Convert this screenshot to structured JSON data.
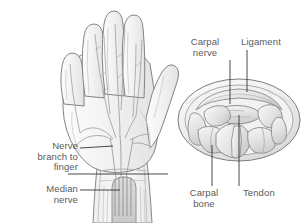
{
  "figure": {
    "background_color": "#ffffff",
    "line_color": "#6e6e6e",
    "text_color": "#5b5b5b",
    "fill_light": "#f4f4f4",
    "fill_mid": "#e4e4e4",
    "fill_dark": "#cfcfcf"
  },
  "labels": {
    "nerve_branch_to_finger": "Nerve\nbranch to\nfinger",
    "median_nerve": "Median\nnerve",
    "carpal_nerve": "Carpal\nnerve",
    "ligament": "Ligament",
    "carpal_bone": "Carpal\nbone",
    "tendon": "Tendon"
  },
  "panels": {
    "left": {
      "name": "palm-view-of-hand",
      "description": "Palmar view of left hand and wrist showing median nerve and its branches to the fingers"
    },
    "right": {
      "name": "carpal-tunnel-cross-section",
      "description": "Cross-section through the wrist showing carpal bones, tendons, carpal nerve and transverse carpal ligament"
    }
  },
  "leaders": {
    "nerve_branch_to_finger": {
      "x1": 80,
      "y1": 148,
      "x2": 113,
      "y2": 146
    },
    "median_nerve": {
      "x1": 80,
      "y1": 190,
      "x2": 120,
      "y2": 190
    },
    "ligament_band": {
      "x1": 68,
      "y1": 174,
      "x2": 168,
      "y2": 174
    },
    "carpal_nerve": {
      "x1": 230,
      "y1": 60,
      "x2": 230,
      "y2": 104
    },
    "ligament": {
      "x1": 247,
      "y1": 50,
      "x2": 247,
      "y2": 92
    },
    "carpal_bone": {
      "x1": 212,
      "y1": 186,
      "x2": 212,
      "y2": 145
    },
    "tendon": {
      "x1": 239,
      "y1": 186,
      "x2": 239,
      "y2": 115
    }
  }
}
